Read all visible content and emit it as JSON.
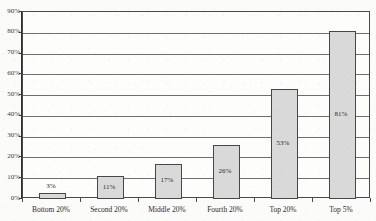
{
  "chart_data": {
    "type": "bar",
    "title": "",
    "xlabel": "",
    "ylabel": "",
    "categories": [
      "Bottom 20%",
      "Second 20%",
      "Middle 20%",
      "Fourth 20%",
      "Top 20%",
      "Top 5%"
    ],
    "values": [
      3,
      11,
      17,
      26,
      53,
      81
    ],
    "value_labels": [
      "3%",
      "11%",
      "17%",
      "26%",
      "53%",
      "81%"
    ],
    "label_placement": [
      "above",
      "inside",
      "inside",
      "inside",
      "inside",
      "inside"
    ],
    "ylim": [
      0,
      90
    ],
    "ytick_values": [
      0,
      10,
      20,
      30,
      40,
      50,
      60,
      70,
      80,
      90
    ],
    "ytick_labels": [
      "0%",
      "10%",
      "20%",
      "30%",
      "40%",
      "50%",
      "60%",
      "70%",
      "80%",
      "90%"
    ],
    "grid": true,
    "legend": "none",
    "bar_fill_color": "#d9d9d9",
    "bar_border_color": "#474747",
    "gridline_color": "#6e6e6e",
    "axis_color": "#2e2e2e",
    "text_color": "#2b2b2b",
    "background_color": "#fbfbfa"
  },
  "title_sliver": {
    "text": ""
  }
}
